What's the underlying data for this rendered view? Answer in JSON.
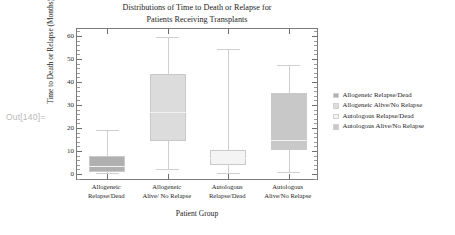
{
  "prompt": {
    "text": "Out[140]="
  },
  "chart_data": {
    "type": "box",
    "title_lines": [
      "Distributions of Time to Death or Relapse for",
      "Patients Receiving Transplants"
    ],
    "xlabel": "Patient Group",
    "ylabel": "Time to Death or Relapse (Months)",
    "ylim": [
      -3,
      63
    ],
    "yticks": [
      0,
      10,
      20,
      30,
      40,
      50,
      60
    ],
    "ytick_labels": [
      "0",
      "10",
      "20",
      "30",
      "40",
      "50",
      "60"
    ],
    "y_minor_step": 2,
    "grid": false,
    "legend_position": "right",
    "categories": [
      {
        "line1": "Allogeneic",
        "line2": "Relapse/Dead"
      },
      {
        "line1": "Allogeneic",
        "line2": "Alive/ No Relapse"
      },
      {
        "line1": "Autologous",
        "line2": "Relapse/Dead"
      },
      {
        "line1": "Autologous",
        "line2": "Alive/No Relapse"
      }
    ],
    "boxes": [
      {
        "name": "Allogeneic Relapse/Dead",
        "whisker_low": 0.5,
        "q1": 1.0,
        "median": 3.5,
        "q3": 8.0,
        "whisker_high": 19.0,
        "color": "#b0b0b0"
      },
      {
        "name": "Allogeneic Alive/No Relapse",
        "whisker_low": 2.0,
        "q1": 14.5,
        "median": 27.0,
        "q3": 43.5,
        "whisker_high": 59.5,
        "color": "#dcdcdc"
      },
      {
        "name": "Autologous Relapse/Dead",
        "whisker_low": 0.5,
        "q1": 4.0,
        "median": 7.0,
        "q3": 10.5,
        "whisker_high": 54.5,
        "color": "#f4f4f4"
      },
      {
        "name": "Autologous Alive/No Relapse",
        "whisker_low": 1.0,
        "q1": 10.5,
        "median": 15.0,
        "q3": 35.0,
        "whisker_high": 47.5,
        "color": "#c8c8c8"
      }
    ],
    "legend": [
      {
        "label": "Allogeneic Relapse/Dead",
        "color": "#b0b0b0"
      },
      {
        "label": "Allogeneic Alive/No Relapse",
        "color": "#dcdcdc"
      },
      {
        "label": "Autologous Relapse/Dead",
        "color": "#f4f4f4"
      },
      {
        "label": "Autologous Alive/No Relapse",
        "color": "#c8c8c8"
      }
    ]
  }
}
